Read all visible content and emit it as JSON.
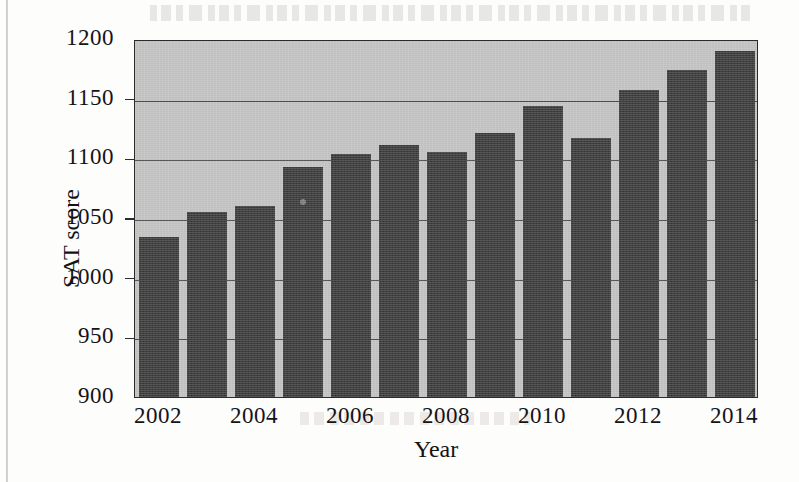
{
  "chart_data": {
    "type": "bar",
    "title": "",
    "xlabel": "Year",
    "ylabel": "SAT score",
    "categories": [
      2002,
      2003,
      2004,
      2005,
      2006,
      2007,
      2008,
      2009,
      2010,
      2011,
      2012,
      2013,
      2014
    ],
    "values": [
      1034,
      1055,
      1060,
      1093,
      1104,
      1111,
      1105,
      1121,
      1144,
      1117,
      1157,
      1174,
      1190
    ],
    "ylim": [
      900,
      1200
    ],
    "ytick_labels": [
      "1200",
      "1150",
      "1100",
      "1050",
      "1000",
      "950",
      "900"
    ],
    "ytick_values": [
      1200,
      1150,
      1100,
      1050,
      1000,
      950,
      900
    ],
    "xtick_labels": [
      "2002",
      "2004",
      "2006",
      "2008",
      "2010",
      "2012",
      "2014"
    ],
    "xtick_values": [
      2002,
      2004,
      2006,
      2008,
      2010,
      2012,
      2014
    ],
    "grid": true,
    "legend": "none",
    "plot_background_color": "#c3c3c3",
    "bar_color": "#3d3d3d",
    "axis_color": "#2b2b2b"
  }
}
